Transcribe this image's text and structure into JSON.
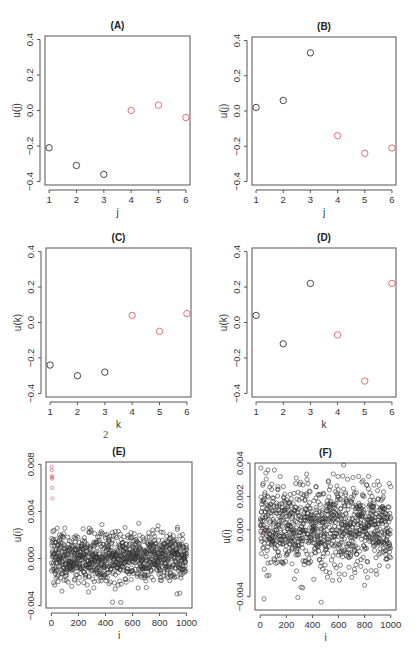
{
  "figure": {
    "stray_label": "2",
    "stroke_color": "#333333",
    "highlight_color": "#e0606a",
    "frame_color": "#555555"
  },
  "chart_data": [
    {
      "id": "A",
      "type": "scatter",
      "title": "(A)",
      "xlabel": "j",
      "ylabel": "u(j)",
      "xlim": [
        0.85,
        6.15
      ],
      "ylim": [
        -0.42,
        0.42
      ],
      "xticks": [
        1,
        2,
        3,
        4,
        5,
        6
      ],
      "xtick_labels": [
        "1",
        "2",
        "3",
        "4",
        "5",
        "6"
      ],
      "yticks": [
        -0.4,
        -0.2,
        0.0,
        0.2,
        0.4
      ],
      "ytick_labels": [
        "-0.4",
        "-0.2",
        "0.0",
        "0.2",
        "0.4"
      ],
      "grid": false,
      "frame_px": {
        "left": 45,
        "top": 36,
        "right": 190,
        "bottom": 185
      },
      "series": [
        {
          "name": "group-1",
          "color": "#333333",
          "x": [
            1,
            2,
            3
          ],
          "y": [
            -0.21,
            -0.31,
            -0.36
          ]
        },
        {
          "name": "group-2",
          "color": "#e0606a",
          "x": [
            4,
            5,
            6
          ],
          "y": [
            0.0,
            0.03,
            -0.04
          ]
        }
      ]
    },
    {
      "id": "B",
      "type": "scatter",
      "title": "(B)",
      "xlabel": "j",
      "ylabel": "u(j)",
      "xlim": [
        0.85,
        6.15
      ],
      "ylim": [
        -0.42,
        0.42
      ],
      "xticks": [
        1,
        2,
        3,
        4,
        5,
        6
      ],
      "xtick_labels": [
        "1",
        "2",
        "3",
        "4",
        "5",
        "6"
      ],
      "yticks": [
        -0.4,
        -0.2,
        0.0,
        0.2,
        0.4
      ],
      "ytick_labels": [
        "-0.4",
        "-0.2",
        "0.0",
        "0.2",
        "0.4"
      ],
      "grid": false,
      "frame_px": {
        "left": 252,
        "top": 37,
        "right": 396,
        "bottom": 185
      },
      "series": [
        {
          "name": "group-1",
          "color": "#333333",
          "x": [
            1,
            2,
            3
          ],
          "y": [
            0.02,
            0.06,
            0.33
          ]
        },
        {
          "name": "group-2",
          "color": "#e0606a",
          "x": [
            4,
            5,
            6
          ],
          "y": [
            -0.14,
            -0.24,
            -0.21
          ]
        }
      ]
    },
    {
      "id": "C",
      "type": "scatter",
      "title": "(C)",
      "xlabel": "k",
      "ylabel": "u(k)",
      "xlim": [
        0.85,
        6.15
      ],
      "ylim": [
        -0.42,
        0.42
      ],
      "xticks": [
        1,
        2,
        3,
        4,
        5,
        6
      ],
      "xtick_labels": [
        "1",
        "2",
        "3",
        "4",
        "5",
        "6"
      ],
      "yticks": [
        -0.4,
        -0.2,
        0.0,
        0.2,
        0.4
      ],
      "ytick_labels": [
        "-0.4",
        "-0.2",
        "0.0",
        "0.2",
        "0.4"
      ],
      "grid": false,
      "frame_px": {
        "left": 46,
        "top": 248,
        "right": 191,
        "bottom": 397
      },
      "series": [
        {
          "name": "group-1",
          "color": "#333333",
          "x": [
            1,
            2,
            3
          ],
          "y": [
            -0.24,
            -0.3,
            -0.28
          ]
        },
        {
          "name": "group-2",
          "color": "#e0606a",
          "x": [
            4,
            5,
            6
          ],
          "y": [
            0.04,
            -0.05,
            0.05
          ]
        }
      ]
    },
    {
      "id": "D",
      "type": "scatter",
      "title": "(D)",
      "xlabel": "k",
      "ylabel": "u(k)",
      "xlim": [
        0.85,
        6.15
      ],
      "ylim": [
        -0.42,
        0.42
      ],
      "xticks": [
        1,
        2,
        3,
        4,
        5,
        6
      ],
      "xtick_labels": [
        "1",
        "2",
        "3",
        "4",
        "5",
        "6"
      ],
      "yticks": [
        -0.4,
        -0.2,
        0.0,
        0.2,
        0.4
      ],
      "ytick_labels": [
        "-0.4",
        "-0.2",
        "0.0",
        "0.2",
        "0.4"
      ],
      "grid": false,
      "frame_px": {
        "left": 252,
        "top": 248,
        "right": 396,
        "bottom": 397
      },
      "series": [
        {
          "name": "group-1",
          "color": "#333333",
          "x": [
            1,
            2,
            3
          ],
          "y": [
            0.04,
            -0.12,
            0.22
          ]
        },
        {
          "name": "group-2",
          "color": "#e0606a",
          "x": [
            4,
            5,
            6
          ],
          "y": [
            -0.07,
            -0.33,
            0.22
          ]
        }
      ]
    },
    {
      "id": "E",
      "type": "scatter",
      "title": "(E)",
      "xlabel": "i",
      "ylabel": "u(i)",
      "xlim": [
        -40,
        1040
      ],
      "ylim": [
        -0.0042,
        0.0082
      ],
      "xticks": [
        0,
        200,
        400,
        600,
        800,
        1000
      ],
      "xtick_labels": [
        "0",
        "200",
        "400",
        "600",
        "800",
        "1000"
      ],
      "yticks": [
        -0.004,
        0.0,
        0.004,
        0.008
      ],
      "ytick_labels": [
        "-0.004",
        "0.000",
        "0.004",
        "0.008"
      ],
      "grid": false,
      "frame_px": {
        "left": 46,
        "top": 462,
        "right": 192,
        "bottom": 608
      },
      "n_points": 1000,
      "distribution": {
        "mean": 0.0001,
        "sd": 0.0011,
        "min": -0.0038,
        "max": 0.0037
      },
      "series": [
        {
          "name": "outliers",
          "color": "#e0606a",
          "x": [
            2,
            3,
            4,
            5,
            6,
            7,
            8
          ],
          "y": [
            0.0078,
            0.0075,
            0.007,
            0.0068,
            0.0069,
            0.006,
            0.0051
          ]
        },
        {
          "name": "bulk",
          "color": "#333333",
          "generated": true
        }
      ]
    },
    {
      "id": "F",
      "type": "scatter",
      "title": "(F)",
      "xlabel": "i",
      "ylabel": "u(i)",
      "xlim": [
        -40,
        1040
      ],
      "ylim": [
        -0.0048,
        0.004
      ],
      "xticks": [
        0,
        200,
        400,
        600,
        800,
        1000
      ],
      "xtick_labels": [
        "0",
        "200",
        "400",
        "600",
        "800",
        "1000"
      ],
      "yticks": [
        -0.004,
        0.0,
        0.002,
        0.004
      ],
      "ytick_labels": [
        "-0.004",
        "0.000",
        "0.002",
        "0.004"
      ],
      "grid": false,
      "frame_px": {
        "left": 255,
        "top": 463,
        "right": 396,
        "bottom": 610
      },
      "n_points": 1000,
      "distribution": {
        "mean": 0.0002,
        "sd": 0.0013,
        "min": -0.0045,
        "max": 0.0039
      },
      "series": [
        {
          "name": "highlighted",
          "color": "#e0606a",
          "x": [
            3,
            5,
            7
          ],
          "y": [
            0.0003,
            -0.0002,
            0.0006
          ]
        },
        {
          "name": "bulk",
          "color": "#333333",
          "generated": true
        }
      ]
    }
  ]
}
